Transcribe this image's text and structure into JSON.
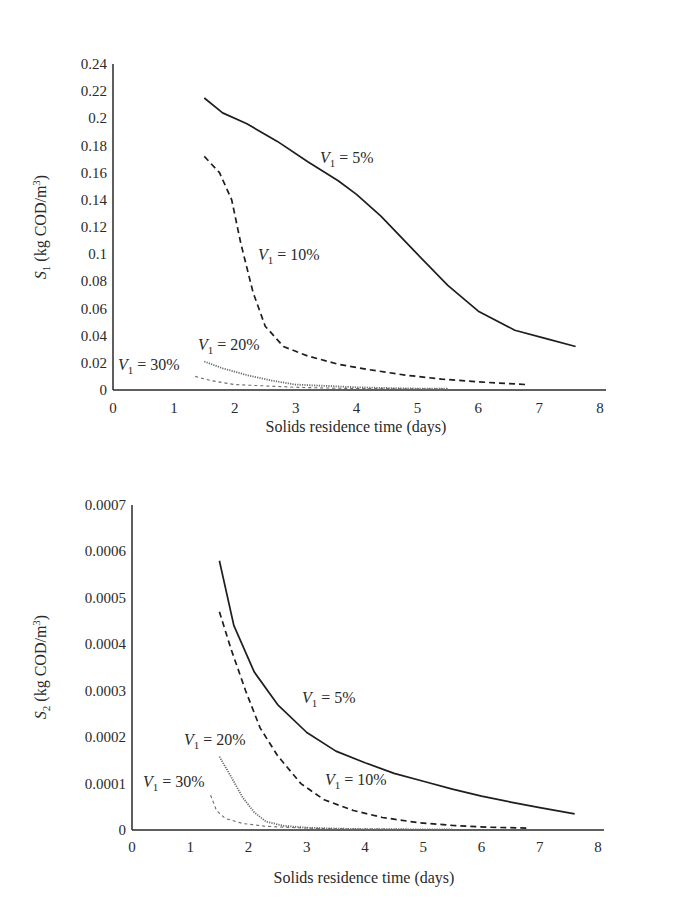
{
  "chart_data": [
    {
      "type": "line",
      "title": "",
      "xlabel": "Solids residence time (days)",
      "ylabel": "S1 (kg COD/m3)",
      "ylabel_parts": {
        "var": "S",
        "sub": "1",
        "unit_pre": " (kg COD/m",
        "sup": "3",
        "unit_post": ")"
      },
      "xlim": [
        0,
        8
      ],
      "ylim": [
        0,
        0.24
      ],
      "xticks": [
        "0",
        "1",
        "2",
        "3",
        "4",
        "5",
        "6",
        "7",
        "8"
      ],
      "yticks": [
        "0",
        "0.02",
        "0.04",
        "0.06",
        "0.08",
        "0.1",
        "0.12",
        "0.14",
        "0.16",
        "0.18",
        "0.2",
        "0.22",
        "0.24"
      ],
      "grid": false,
      "legend": "inline annotations",
      "series": [
        {
          "name": "V1 = 5%",
          "style": "solid",
          "x": [
            1.5,
            1.8,
            2.2,
            2.7,
            3.2,
            3.7,
            4.0,
            4.4,
            5.0,
            5.5,
            6.0,
            6.6,
            7.1,
            7.6
          ],
          "y": [
            0.215,
            0.204,
            0.196,
            0.183,
            0.168,
            0.154,
            0.144,
            0.128,
            0.1,
            0.077,
            0.058,
            0.044,
            0.038,
            0.032
          ]
        },
        {
          "name": "V1 = 10%",
          "style": "dashed",
          "x": [
            1.5,
            1.75,
            1.95,
            2.1,
            2.3,
            2.5,
            2.8,
            3.2,
            3.7,
            4.2,
            4.8,
            5.4,
            6.0,
            6.8
          ],
          "y": [
            0.172,
            0.16,
            0.14,
            0.108,
            0.072,
            0.047,
            0.032,
            0.025,
            0.019,
            0.015,
            0.011,
            0.008,
            0.006,
            0.004
          ]
        },
        {
          "name": "V1 = 20%",
          "style": "dotted",
          "x": [
            1.5,
            1.8,
            2.2,
            2.6,
            3.0,
            3.5,
            4.0,
            4.5,
            5.0,
            5.5
          ],
          "y": [
            0.021,
            0.016,
            0.011,
            0.007,
            0.004,
            0.003,
            0.002,
            0.0015,
            0.001,
            0.001
          ]
        },
        {
          "name": "V1 = 30%",
          "style": "fine-dashed",
          "x": [
            1.35,
            1.6,
            2.0,
            2.5,
            3.0,
            3.5,
            4.0,
            4.5,
            5.0,
            5.5
          ],
          "y": [
            0.01,
            0.007,
            0.004,
            0.003,
            0.002,
            0.0015,
            0.001,
            0.001,
            0.0008,
            0.0008
          ]
        }
      ],
      "annotations": [
        {
          "series": "V1 = 5%",
          "var": "V",
          "sub": "1",
          "text": " = 5%",
          "px": 320,
          "py": 163
        },
        {
          "series": "V1 = 10%",
          "var": "V",
          "sub": "1",
          "text": " = 10%",
          "px": 258,
          "py": 260
        },
        {
          "series": "V1 = 20%",
          "var": "V",
          "sub": "1",
          "text": " = 20%",
          "px": 198,
          "py": 350
        },
        {
          "series": "V1 = 30%",
          "var": "V",
          "sub": "1",
          "text": " = 30%",
          "px": 118,
          "py": 370
        }
      ]
    },
    {
      "type": "line",
      "title": "",
      "xlabel": "Solids residence time (days)",
      "ylabel": "S2 (kg COD/m3)",
      "ylabel_parts": {
        "var": "S",
        "sub": "2",
        "unit_pre": " (kg COD/m",
        "sup": "3",
        "unit_post": ")"
      },
      "xlim": [
        0,
        8
      ],
      "ylim": [
        0,
        0.0007
      ],
      "xticks": [
        "0",
        "1",
        "2",
        "3",
        "4",
        "5",
        "6",
        "7",
        "8"
      ],
      "yticks": [
        "0",
        "0.0001",
        "0.0002",
        "0.0003",
        "0.0004",
        "0.0005",
        "0.0006",
        "0.0007"
      ],
      "grid": false,
      "legend": "inline annotations",
      "series": [
        {
          "name": "V1 = 5%",
          "style": "solid",
          "x": [
            1.5,
            1.75,
            2.1,
            2.5,
            3.0,
            3.5,
            4.0,
            4.5,
            5.0,
            5.5,
            6.0,
            6.5,
            7.0,
            7.6
          ],
          "y": [
            0.00058,
            0.00044,
            0.00034,
            0.00027,
            0.00021,
            0.00017,
            0.000145,
            0.000122,
            0.000105,
            8.8e-05,
            7.3e-05,
            6e-05,
            4.8e-05,
            3.5e-05
          ]
        },
        {
          "name": "V1 = 10%",
          "style": "dashed",
          "x": [
            1.5,
            1.7,
            1.95,
            2.2,
            2.5,
            2.9,
            3.3,
            3.8,
            4.3,
            4.9,
            5.5,
            6.1,
            6.8
          ],
          "y": [
            0.00047,
            0.00039,
            0.0003,
            0.00022,
            0.00016,
            0.0001,
            6.5e-05,
            4.2e-05,
            2.7e-05,
            1.6e-05,
            1e-05,
            6e-06,
            4e-06
          ]
        },
        {
          "name": "V1 = 20%",
          "style": "dotted",
          "x": [
            1.5,
            1.7,
            1.9,
            2.1,
            2.3,
            2.6,
            3.0,
            3.5,
            4.0,
            4.5,
            5.0,
            5.5
          ],
          "y": [
            0.000158,
            0.000115,
            7e-05,
            3.8e-05,
            1.8e-05,
            9e-06,
            5e-06,
            3e-06,
            2e-06,
            2e-06,
            1e-06,
            1e-06
          ]
        },
        {
          "name": "V1 = 30%",
          "style": "fine-dashed",
          "x": [
            1.35,
            1.45,
            1.6,
            1.9,
            2.3,
            2.8,
            3.3,
            3.8,
            4.3,
            4.8,
            5.3
          ],
          "y": [
            7.5e-05,
            4.2e-05,
            2.5e-05,
            1.4e-05,
            8e-06,
            5e-06,
            3e-06,
            2e-06,
            2e-06,
            1e-06,
            1e-06
          ]
        }
      ],
      "annotations": [
        {
          "series": "V1 = 5%",
          "var": "V",
          "sub": "1",
          "text": " = 5%",
          "px": 302,
          "py": 703
        },
        {
          "series": "V1 = 10%",
          "var": "V",
          "sub": "1",
          "text": " = 10%",
          "px": 325,
          "py": 785
        },
        {
          "series": "V1 = 20%",
          "var": "V",
          "sub": "1",
          "text": " = 20%",
          "px": 184,
          "py": 745
        },
        {
          "series": "V1 = 30%",
          "var": "V",
          "sub": "1",
          "text": " = 30%",
          "px": 143,
          "py": 787
        }
      ]
    }
  ],
  "styles": {
    "line_color": "#1e1e1e",
    "faint_line_color": "#6a6a6a",
    "axis_color": "#2a2a2a"
  },
  "layout": [
    {
      "x0": 113,
      "x1": 600,
      "y0": 390,
      "y1": 64,
      "ylabel_x": 46,
      "ylabel_y": 227,
      "xlabel_x": 356,
      "xlabel_y": 432,
      "xtick_y": 413,
      "offset_y": 0
    },
    {
      "x0": 132,
      "x1": 598,
      "y0": 830,
      "y1": 505,
      "ylabel_x": 46,
      "ylabel_y": 667,
      "xlabel_x": 364,
      "xlabel_y": 883,
      "xtick_y": 852,
      "offset_y": 460
    }
  ]
}
